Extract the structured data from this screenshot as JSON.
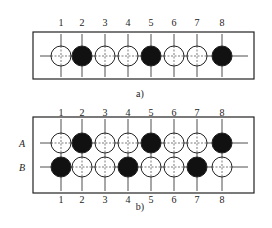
{
  "diagrams": [
    {
      "id": "a",
      "caption": "a)",
      "column_labels": [
        "1",
        "2",
        "3",
        "4",
        "5",
        "6",
        "7",
        "8"
      ],
      "rows": [
        {
          "label": "",
          "states": [
            "white",
            "black",
            "white",
            "white",
            "black",
            "white",
            "white",
            "black"
          ]
        }
      ]
    },
    {
      "id": "b",
      "caption": "b)",
      "column_labels": [
        "1",
        "2",
        "3",
        "4",
        "5",
        "6",
        "7",
        "8"
      ],
      "rows": [
        {
          "label": "A",
          "states": [
            "white",
            "black",
            "white",
            "white",
            "black",
            "white",
            "white",
            "black"
          ]
        },
        {
          "label": "B",
          "states": [
            "black",
            "white",
            "white",
            "black",
            "white",
            "white",
            "black",
            "white"
          ]
        }
      ]
    }
  ],
  "colors": {
    "stroke": "#222222",
    "filled": "#111111",
    "empty": "#ffffff"
  }
}
